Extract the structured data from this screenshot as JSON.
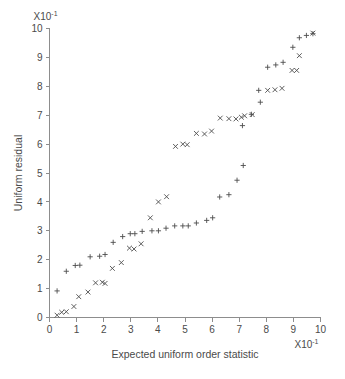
{
  "chart_data": {
    "type": "scatter",
    "title": "",
    "xlabel": "Expected uniform order statistic",
    "ylabel": "Uniform residual",
    "x_multiplier_label": "X10",
    "x_multiplier_exponent": "-1",
    "y_multiplier_label": "X10",
    "y_multiplier_exponent": "-1",
    "xlim": [
      0,
      10
    ],
    "ylim": [
      0,
      10
    ],
    "xticks": [
      "0",
      "1",
      "2",
      "3",
      "4",
      "5",
      "6",
      "7",
      "8",
      "9",
      "10"
    ],
    "yticks": [
      "0",
      "1",
      "2",
      "3",
      "4",
      "5",
      "6",
      "7",
      "8",
      "9",
      "10"
    ],
    "grid": false,
    "legend": "none",
    "marker_color": "#4d4d4d",
    "axis_color": "#8d8d8d",
    "series": [
      {
        "name": "plus-series",
        "marker": "plus",
        "points": [
          [
            0.28,
            0.92
          ],
          [
            0.62,
            1.6
          ],
          [
            0.95,
            1.8
          ],
          [
            1.12,
            1.81
          ],
          [
            1.5,
            2.1
          ],
          [
            1.85,
            2.12
          ],
          [
            2.05,
            2.18
          ],
          [
            2.35,
            2.6
          ],
          [
            2.7,
            2.8
          ],
          [
            2.98,
            2.9
          ],
          [
            3.15,
            2.9
          ],
          [
            3.42,
            2.98
          ],
          [
            3.78,
            3.0
          ],
          [
            4.02,
            3.0
          ],
          [
            4.3,
            3.09
          ],
          [
            4.62,
            3.17
          ],
          [
            4.92,
            3.17
          ],
          [
            5.12,
            3.17
          ],
          [
            5.42,
            3.27
          ],
          [
            5.8,
            3.36
          ],
          [
            6.02,
            3.45
          ],
          [
            6.28,
            4.17
          ],
          [
            6.62,
            4.25
          ],
          [
            6.92,
            4.75
          ],
          [
            7.15,
            5.26
          ],
          [
            7.12,
            6.64
          ],
          [
            7.45,
            7.03
          ],
          [
            7.72,
            7.86
          ],
          [
            7.78,
            7.45
          ],
          [
            8.05,
            8.66
          ],
          [
            8.35,
            8.74
          ],
          [
            8.62,
            8.83
          ],
          [
            8.98,
            9.35
          ],
          [
            9.22,
            9.68
          ],
          [
            9.48,
            9.76
          ],
          [
            9.72,
            9.82
          ]
        ]
      },
      {
        "name": "x-series",
        "marker": "ex",
        "points": [
          [
            0.28,
            0.08
          ],
          [
            0.45,
            0.18
          ],
          [
            0.62,
            0.2
          ],
          [
            0.9,
            0.38
          ],
          [
            1.08,
            0.72
          ],
          [
            1.42,
            0.88
          ],
          [
            1.7,
            1.2
          ],
          [
            1.95,
            1.22
          ],
          [
            2.05,
            1.18
          ],
          [
            2.32,
            1.7
          ],
          [
            2.65,
            1.9
          ],
          [
            2.95,
            2.4
          ],
          [
            3.12,
            2.37
          ],
          [
            3.38,
            2.55
          ],
          [
            3.72,
            3.45
          ],
          [
            4.02,
            4.0
          ],
          [
            4.32,
            4.18
          ],
          [
            4.65,
            5.92
          ],
          [
            4.92,
            6.0
          ],
          [
            5.08,
            5.98
          ],
          [
            5.42,
            6.37
          ],
          [
            5.72,
            6.35
          ],
          [
            5.98,
            6.45
          ],
          [
            6.3,
            6.9
          ],
          [
            6.62,
            6.88
          ],
          [
            6.88,
            6.87
          ],
          [
            7.08,
            6.93
          ],
          [
            7.2,
            6.98
          ],
          [
            7.48,
            7.02
          ],
          [
            8.05,
            7.86
          ],
          [
            8.32,
            7.88
          ],
          [
            8.58,
            7.93
          ],
          [
            8.95,
            8.55
          ],
          [
            9.12,
            8.55
          ],
          [
            9.22,
            9.06
          ],
          [
            9.72,
            9.84
          ]
        ]
      }
    ]
  }
}
